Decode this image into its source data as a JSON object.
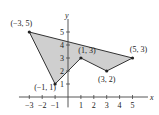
{
  "chart_data": {
    "type": "line",
    "title": "",
    "xlabel": "x",
    "ylabel": "y",
    "xlim": [
      -3.8,
      6.2
    ],
    "ylim": [
      -0.8,
      6.0
    ],
    "grid": false,
    "legend": null,
    "polygon": {
      "fill": "#cfcfcf",
      "stroke": "#333333",
      "vertices": [
        {
          "x": -3,
          "y": 5,
          "label": "(−3, 5)"
        },
        {
          "x": 5,
          "y": 3,
          "label": "(5, 3)"
        },
        {
          "x": 3,
          "y": 2,
          "label": "(3, 2)"
        },
        {
          "x": 1,
          "y": 3,
          "label": "(1, 3)"
        },
        {
          "x": -1,
          "y": 1,
          "label": "(−1, 1)"
        }
      ]
    },
    "x_ticks": [
      {
        "v": -3,
        "label": "−3"
      },
      {
        "v": -2,
        "label": "−2"
      },
      {
        "v": -1,
        "label": "−1"
      },
      {
        "v": 1,
        "label": "1"
      },
      {
        "v": 2,
        "label": "2"
      },
      {
        "v": 3,
        "label": "3"
      },
      {
        "v": 4,
        "label": "4"
      },
      {
        "v": 5,
        "label": "5"
      }
    ],
    "y_ticks": [
      {
        "v": 1,
        "label": "1"
      },
      {
        "v": 2,
        "label": "2"
      },
      {
        "v": 3,
        "label": "3"
      },
      {
        "v": 4,
        "label": "4"
      },
      {
        "v": 5,
        "label": "5"
      }
    ]
  }
}
